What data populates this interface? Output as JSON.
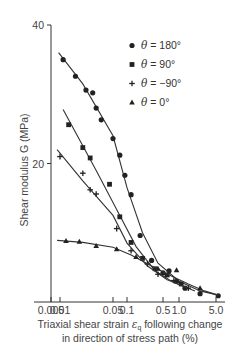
{
  "chart_data": {
    "type": "scatter",
    "title": "",
    "xlabel_line1": "Triaxial shear strain ε_q following change",
    "xlabel_line2": "in direction of stress path (%)",
    "ylabel": "Shear modulus G (MPa)",
    "xscale": "log",
    "xlim": [
      0.004,
      6.0
    ],
    "ylim": [
      0,
      40
    ],
    "x_ticks": [
      0.005,
      0.01,
      0.05,
      0.1,
      0.5,
      1.0,
      5.0
    ],
    "x_tick_labels": [
      "0.005",
      "0.01",
      "0.05",
      "0.1",
      "0.5",
      "1.0",
      "5.0"
    ],
    "y_ticks": [
      20,
      40
    ],
    "y_tick_labels": [
      "20",
      "40"
    ],
    "grid": false,
    "legend_position": "upper right",
    "series": [
      {
        "name": "θ = 180°",
        "marker": "circle",
        "points": [
          [
            0.011,
            35.0
          ],
          [
            0.016,
            32.6
          ],
          [
            0.022,
            30.6
          ],
          [
            0.027,
            30.2
          ],
          [
            0.03,
            28.0
          ],
          [
            0.035,
            26.3
          ],
          [
            0.05,
            23.6
          ],
          [
            0.07,
            21.2
          ],
          [
            0.09,
            18.3
          ],
          [
            0.12,
            15.5
          ],
          [
            0.18,
            9.6
          ],
          [
            0.3,
            6.0
          ],
          [
            0.5,
            4.2
          ],
          [
            0.65,
            4.5
          ],
          [
            0.9,
            3.0
          ],
          [
            1.3,
            2.0
          ],
          [
            2.5,
            1.2
          ],
          [
            5.5,
            0.9
          ]
        ],
        "fit": [
          [
            0.009,
            36.0
          ],
          [
            0.02,
            31.5
          ],
          [
            0.05,
            24.0
          ],
          [
            0.1,
            16.5
          ],
          [
            0.2,
            10.0
          ],
          [
            0.4,
            5.6
          ],
          [
            1.0,
            3.0
          ],
          [
            2.5,
            1.6
          ],
          [
            5.5,
            1.0
          ]
        ]
      },
      {
        "name": "θ = 90°",
        "marker": "square",
        "points": [
          [
            0.013,
            25.6
          ],
          [
            0.02,
            22.3
          ],
          [
            0.025,
            20.8
          ],
          [
            0.045,
            17.0
          ],
          [
            0.07,
            12.3
          ],
          [
            0.12,
            8.6
          ],
          [
            0.2,
            6.3
          ],
          [
            0.35,
            4.8
          ],
          [
            0.6,
            3.9
          ],
          [
            1.1,
            2.6
          ]
        ],
        "fit": [
          [
            0.011,
            27.8
          ],
          [
            0.03,
            19.0
          ],
          [
            0.07,
            12.5
          ],
          [
            0.15,
            8.0
          ],
          [
            0.35,
            4.5
          ],
          [
            0.8,
            2.8
          ],
          [
            2.0,
            1.6
          ]
        ]
      },
      {
        "name": "θ = -90°",
        "marker": "plus",
        "points": [
          [
            0.01,
            21.0
          ],
          [
            0.02,
            18.6
          ],
          [
            0.025,
            16.2
          ],
          [
            0.03,
            15.6
          ],
          [
            0.06,
            10.6
          ],
          [
            0.12,
            7.4
          ],
          [
            0.25,
            5.5
          ],
          [
            0.4,
            4.0
          ],
          [
            0.8,
            3.1
          ],
          [
            1.5,
            2.0
          ]
        ],
        "fit": [
          [
            0.008,
            22.0
          ],
          [
            0.02,
            17.5
          ],
          [
            0.05,
            12.5
          ],
          [
            0.1,
            8.5
          ],
          [
            0.25,
            5.2
          ],
          [
            0.6,
            3.2
          ],
          [
            1.5,
            2.0
          ]
        ]
      },
      {
        "name": "θ = 0°",
        "marker": "triangle",
        "points": [
          [
            0.012,
            8.8
          ],
          [
            0.018,
            8.7
          ],
          [
            0.03,
            8.1
          ],
          [
            0.06,
            7.6
          ],
          [
            0.15,
            6.5
          ],
          [
            0.4,
            4.8
          ],
          [
            0.9,
            4.6
          ],
          [
            2.5,
            2.0
          ]
        ],
        "fit": [
          [
            0.008,
            8.9
          ],
          [
            0.02,
            8.6
          ],
          [
            0.05,
            7.9
          ],
          [
            0.12,
            6.8
          ],
          [
            0.3,
            5.2
          ],
          [
            0.7,
            3.8
          ],
          [
            1.5,
            2.6
          ],
          [
            3.0,
            1.6
          ],
          [
            5.5,
            1.0
          ]
        ]
      }
    ]
  },
  "legend": {
    "items": [
      {
        "symbol": "circle",
        "theta_sym": "θ",
        "rest": " = 180°"
      },
      {
        "symbol": "square",
        "theta_sym": "θ",
        "rest": " = 90°"
      },
      {
        "symbol": "plus",
        "theta_sym": "θ",
        "rest": " = −90°"
      },
      {
        "symbol": "triangle",
        "theta_sym": "θ",
        "rest": " = 0°"
      }
    ]
  },
  "axes": {
    "ylabel": "Shear modulus G (MPa)",
    "xlabel_line1_pre": "Triaxial shear strain ",
    "xlabel_line1_sym": "ε",
    "xlabel_line1_sub": "q",
    "xlabel_line1_post": " following change",
    "xlabel_line2": "in direction of stress path (%)"
  }
}
